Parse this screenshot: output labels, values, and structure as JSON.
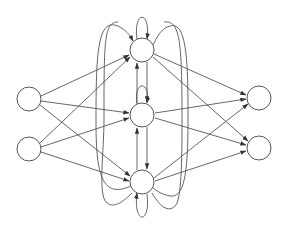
{
  "diagram": {
    "type": "recurrent-neural-network",
    "caption": "",
    "colors": {
      "stroke": "#555555",
      "node_fill": "#ffffff",
      "background": "#ffffff"
    },
    "node_radius": 12,
    "layers": [
      {
        "name": "input",
        "nodes": [
          {
            "id": "i1",
            "x": 29,
            "y": 99
          },
          {
            "id": "i2",
            "x": 29,
            "y": 149
          }
        ]
      },
      {
        "name": "hidden",
        "nodes": [
          {
            "id": "h1",
            "x": 142,
            "y": 50
          },
          {
            "id": "h2",
            "x": 142,
            "y": 115
          },
          {
            "id": "h3",
            "x": 142,
            "y": 182
          }
        ]
      },
      {
        "name": "output",
        "nodes": [
          {
            "id": "o1",
            "x": 259,
            "y": 98
          },
          {
            "id": "o2",
            "x": 259,
            "y": 148
          }
        ]
      }
    ],
    "edges": [
      {
        "from": "i1",
        "to": "h1"
      },
      {
        "from": "i1",
        "to": "h2"
      },
      {
        "from": "i1",
        "to": "h3"
      },
      {
        "from": "i2",
        "to": "h1"
      },
      {
        "from": "i2",
        "to": "h2"
      },
      {
        "from": "i2",
        "to": "h3"
      },
      {
        "from": "h1",
        "to": "o1"
      },
      {
        "from": "h1",
        "to": "o2"
      },
      {
        "from": "h2",
        "to": "o1"
      },
      {
        "from": "h2",
        "to": "o2"
      },
      {
        "from": "h3",
        "to": "o1"
      },
      {
        "from": "h3",
        "to": "o2"
      },
      {
        "from": "h1",
        "to": "h1",
        "kind": "self-loop"
      },
      {
        "from": "h2",
        "to": "h2",
        "kind": "self-loop"
      },
      {
        "from": "h3",
        "to": "h3",
        "kind": "self-loop"
      },
      {
        "from": "h1",
        "to": "h2"
      },
      {
        "from": "h2",
        "to": "h1"
      },
      {
        "from": "h1",
        "to": "h3"
      },
      {
        "from": "h3",
        "to": "h1"
      },
      {
        "from": "h2",
        "to": "h3"
      },
      {
        "from": "h3",
        "to": "h2"
      }
    ]
  }
}
